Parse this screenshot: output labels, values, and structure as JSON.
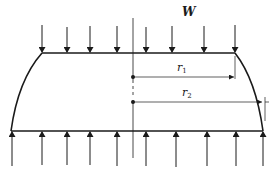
{
  "diagram": {
    "load_label": "W",
    "radius1": {
      "symbol": "r",
      "subscript": "1"
    },
    "radius2": {
      "symbol": "r",
      "subscript": "2"
    },
    "top_arrows_count": 8,
    "bottom_arrows_count": 10,
    "line_color": "#1a1a1a"
  }
}
